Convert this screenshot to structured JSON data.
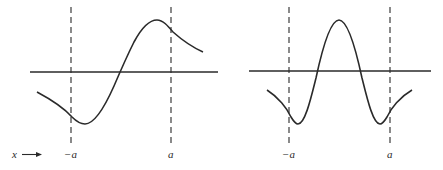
{
  "figure": {
    "type": "diagram",
    "colors": {
      "ink": "#2a2a2a",
      "background": "#ffffff"
    },
    "x_label": "x",
    "x_arrow": "→",
    "panels": [
      {
        "name": "odd-state",
        "boundary_labels": [
          "−a",
          "a"
        ],
        "curve": "odd function: minimum near -a, crosses zero at center, maximum near a, decaying outside"
      },
      {
        "name": "even-state",
        "boundary_labels": [
          "−a",
          "a"
        ],
        "curve": "even function: central maximum, two zero crossings, minima near ±a, rising toward axis outside"
      }
    ]
  },
  "labels": {
    "x": "x",
    "left_neg_a": "−a",
    "left_a": "a",
    "right_neg_a": "−a",
    "right_a": "a"
  }
}
